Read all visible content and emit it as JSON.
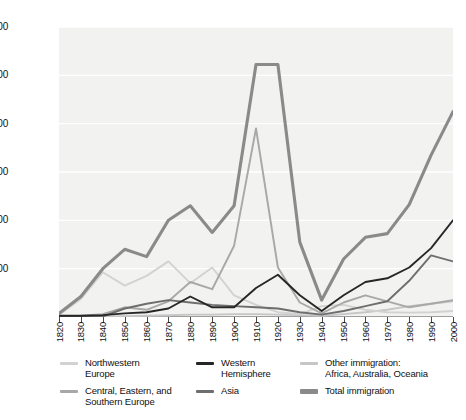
{
  "axes": {
    "ylabel": "Immigrants per decade\n(thousands)",
    "yticks": [
      "1,200",
      "1,000",
      "800",
      "600",
      "400",
      "200"
    ],
    "xticks": [
      "1820",
      "1830",
      "1840",
      "1850",
      "1860",
      "1870",
      "1880",
      "1890",
      "1900",
      "1910",
      "1920",
      "1930",
      "1940",
      "1950",
      "1960",
      "1970",
      "1980",
      "1990",
      "2000"
    ]
  },
  "legend": [
    {
      "label": "Northwestern\nEurope",
      "color": "#d2d2d2",
      "thick": false
    },
    {
      "label": "Central, Eastern, and\nSouthern Europe",
      "color": "#a8a8a8",
      "thick": false
    },
    {
      "label": "Western\nHemisphere",
      "color": "#262626",
      "thick": false
    },
    {
      "label": "Asia",
      "color": "#6e6e6e",
      "thick": false
    },
    {
      "label": "Other immigration:\nAfrica, Australia, Oceania",
      "color": "#c6c6c6",
      "thick": false
    },
    {
      "label": "Total immigration",
      "color": "#8a8a8a",
      "thick": true
    }
  ],
  "chart_data": {
    "type": "line",
    "title": "",
    "xlabel": "",
    "ylabel": "Immigrants per decade (thousands)",
    "x": [
      1820,
      1830,
      1840,
      1850,
      1860,
      1870,
      1880,
      1890,
      1900,
      1910,
      1920,
      1930,
      1940,
      1950,
      1960,
      1970,
      1980,
      1990,
      2000
    ],
    "xlim": [
      1820,
      2000
    ],
    "ylim": [
      0,
      1200
    ],
    "grid": true,
    "legend_position": "bottom",
    "series": [
      {
        "name": "Northwestern Europe",
        "color": "#d2d2d2",
        "values": [
          8,
          75,
          185,
          130,
          170,
          230,
          140,
          205,
          90,
          50,
          20,
          12,
          45,
          50,
          30,
          20,
          18,
          20,
          25
        ]
      },
      {
        "name": "Central, Eastern, and Southern Europe",
        "color": "#a8a8a8",
        "values": [
          2,
          5,
          12,
          40,
          30,
          65,
          145,
          115,
          295,
          780,
          205,
          60,
          15,
          60,
          90,
          65,
          40,
          55,
          70
        ]
      },
      {
        "name": "Western Hemisphere",
        "color": "#262626",
        "values": [
          5,
          5,
          8,
          15,
          20,
          35,
          85,
          40,
          40,
          120,
          175,
          90,
          25,
          90,
          145,
          160,
          205,
          285,
          400
        ]
      },
      {
        "name": "Asia",
        "color": "#6e6e6e",
        "values": [
          1,
          1,
          2,
          35,
          55,
          70,
          60,
          50,
          45,
          40,
          35,
          20,
          10,
          25,
          45,
          65,
          150,
          255,
          230
        ]
      },
      {
        "name": "Other immigration: Africa, Australia, Oceania",
        "color": "#c6c6c6",
        "values": [
          1,
          1,
          2,
          3,
          5,
          7,
          10,
          10,
          12,
          12,
          10,
          8,
          5,
          12,
          20,
          30,
          45,
          55,
          65
        ]
      },
      {
        "name": "Total immigration",
        "color": "#8a8a8a",
        "values": [
          15,
          85,
          200,
          280,
          250,
          400,
          460,
          350,
          460,
          1045,
          1045,
          310,
          70,
          240,
          330,
          345,
          465,
          670,
          850
        ]
      }
    ]
  }
}
